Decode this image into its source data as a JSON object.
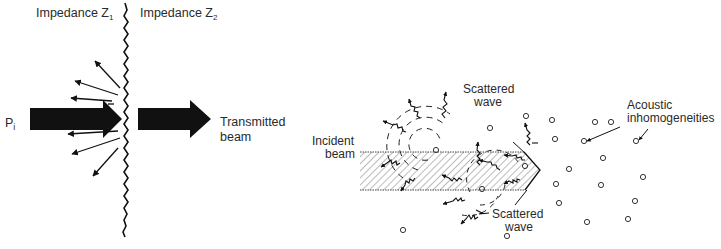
{
  "panel_left": {
    "label_z1": "Impedance Z",
    "label_z1_sub": "1",
    "label_z2": "Impedance Z",
    "label_z2_sub": "2",
    "label_incident": "P",
    "label_incident_sub": "i",
    "label_transmitted_line1": "Transmitted",
    "label_transmitted_line2": "beam"
  },
  "panel_right": {
    "label_incident_line1": "Incident",
    "label_incident_line2": "beam",
    "label_scattered_top_line1": "Scattered",
    "label_scattered_top_line2": "wave",
    "label_scattered_bottom_line1": "Scattered",
    "label_scattered_bottom_line2": "wave",
    "label_inhomog_line1": "Acoustic",
    "label_inhomog_line2": "inhomogeneities"
  },
  "colors": {
    "ink": "#111111",
    "text": "#2a2a2a",
    "background": "#ffffff"
  }
}
